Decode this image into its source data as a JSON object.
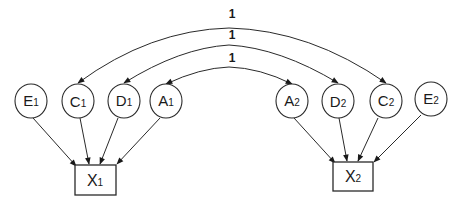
{
  "diagram": {
    "type": "path-diagram",
    "latent_nodes": [
      {
        "id": "E1",
        "letter": "E",
        "sub": "1",
        "cx": 31,
        "cy": 101
      },
      {
        "id": "C1",
        "letter": "C",
        "sub": "1",
        "cx": 78,
        "cy": 101
      },
      {
        "id": "D1",
        "letter": "D",
        "sub": "1",
        "cx": 124,
        "cy": 101
      },
      {
        "id": "A1",
        "letter": "A",
        "sub": "1",
        "cx": 166,
        "cy": 101
      },
      {
        "id": "A2",
        "letter": "A",
        "sub": "2",
        "cx": 292,
        "cy": 101
      },
      {
        "id": "D2",
        "letter": "D",
        "sub": "2",
        "cx": 338,
        "cy": 101
      },
      {
        "id": "C2",
        "letter": "C",
        "sub": "2",
        "cx": 386,
        "cy": 101
      },
      {
        "id": "E2",
        "letter": "E",
        "sub": "2",
        "cx": 431,
        "cy": 99
      }
    ],
    "observed_nodes": [
      {
        "id": "X1",
        "letter": "X",
        "sub": "1",
        "x": 75,
        "y": 165,
        "w": 41,
        "h": 30
      },
      {
        "id": "X2",
        "letter": "X",
        "sub": "2",
        "x": 333,
        "y": 162,
        "w": 40,
        "h": 29
      }
    ],
    "correlations": [
      {
        "from": "C1",
        "to": "C2",
        "label": "1"
      },
      {
        "from": "D1",
        "to": "D2",
        "label": "1"
      },
      {
        "from": "A1",
        "to": "A2",
        "label": "1"
      }
    ],
    "paths": [
      {
        "from": "E1",
        "to": "X1"
      },
      {
        "from": "C1",
        "to": "X1"
      },
      {
        "from": "D1",
        "to": "X1"
      },
      {
        "from": "A1",
        "to": "X1"
      },
      {
        "from": "A2",
        "to": "X2"
      },
      {
        "from": "D2",
        "to": "X2"
      },
      {
        "from": "C2",
        "to": "X2"
      },
      {
        "from": "E2",
        "to": "X2"
      }
    ],
    "labels": {
      "corr_outer": "1",
      "corr_middle": "1",
      "corr_inner": "1"
    },
    "colors": {
      "line": "#2a2a2a",
      "background": "#ffffff",
      "text": "#1a1a1a"
    }
  }
}
